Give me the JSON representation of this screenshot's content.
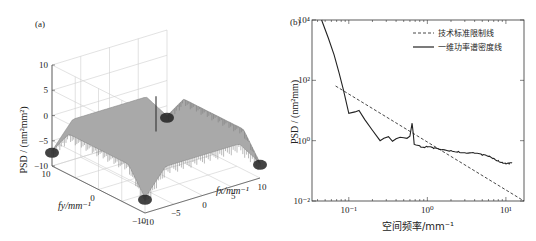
{
  "chart_data": [
    {
      "panel": "(a)",
      "type": "surface3d",
      "title": "",
      "xlabel": "fx/mm⁻¹",
      "ylabel": "fy/mm⁻¹",
      "zlabel": "PSD / (nm²mm²)",
      "x_ticks": [
        "-10",
        "-5",
        "0",
        "5",
        "10"
      ],
      "y_ticks": [
        "10",
        "0",
        "-10"
      ],
      "z_ticks": [
        "10",
        "5",
        "0",
        "-5",
        "-10"
      ],
      "xlim": [
        -10,
        10
      ],
      "ylim": [
        -10,
        10
      ],
      "zlim": [
        -10,
        10
      ],
      "surface_description": "Nearly flat plateau at about PSD ≈ -2 (log scale) across the frequency plane, falling to about -7 at the four corners, with a narrow spike reaching about 5 near the centre (fx≈0, fy≈0).",
      "plateau_level": -2,
      "corner_level": -7,
      "center_peak": 5,
      "grid": true
    },
    {
      "panel": "(b)",
      "type": "line",
      "xscale": "log",
      "yscale": "log",
      "xlabel": "空间频率/mm⁻¹",
      "ylabel": "PSD / (nm²mm)",
      "x_ticks": [
        "10⁻¹",
        "10⁰",
        "10¹"
      ],
      "y_ticks": [
        "10⁴",
        "10²",
        "10⁰",
        "10⁻²"
      ],
      "x_tick_values": [
        0.1,
        1,
        10
      ],
      "y_tick_values": [
        10000,
        100,
        1,
        0.01
      ],
      "xlim": [
        0.034,
        17
      ],
      "ylim": [
        0.01,
        10000
      ],
      "grid": false,
      "legend_position": "top-right",
      "series": [
        {
          "name": "技术标准限制线",
          "style": "dashed",
          "x": [
            0.068,
            17
          ],
          "y": [
            65,
            0.01
          ]
        },
        {
          "name": "一维功率谱密度线",
          "style": "solid",
          "x": [
            0.045,
            0.055,
            0.065,
            0.075,
            0.085,
            0.1,
            0.12,
            0.135,
            0.16,
            0.2,
            0.25,
            0.28,
            0.32,
            0.36,
            0.4,
            0.45,
            0.5,
            0.55,
            0.6,
            0.64,
            0.66,
            0.68,
            0.72,
            0.8,
            0.9,
            1.0,
            1.2,
            1.5,
            2,
            2.5,
            3,
            4,
            5,
            6,
            7,
            8,
            9,
            10,
            11,
            12
          ],
          "y": [
            10000,
            2500,
            700,
            180,
            50,
            8,
            9,
            10,
            5,
            2.2,
            1.0,
            1.2,
            1.35,
            0.95,
            1.15,
            1.3,
            1.25,
            1.2,
            1.4,
            3.8,
            1.8,
            0.75,
            0.72,
            0.68,
            0.6,
            0.62,
            0.55,
            0.5,
            0.47,
            0.44,
            0.4,
            0.38,
            0.33,
            0.3,
            0.26,
            0.22,
            0.19,
            0.17,
            0.17,
            0.18
          ]
        }
      ]
    }
  ]
}
